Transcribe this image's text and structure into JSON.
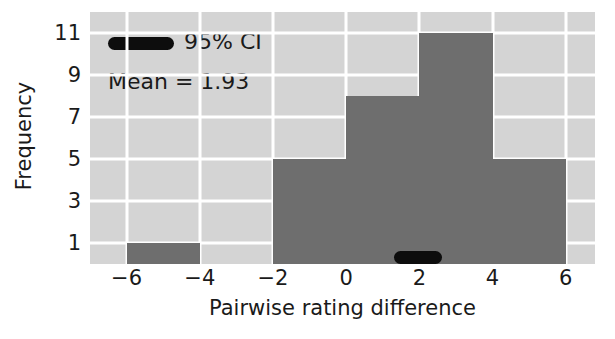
{
  "chart_data": {
    "type": "bar",
    "title": "",
    "subtitle": "",
    "xlabel": "Pairwise rating difference",
    "ylabel": "Frequency",
    "grid": true,
    "grid_color": "#ffffff",
    "plot_bg": "#d4d4d4",
    "bar_color": "#6e6e6e",
    "annotation_color": "#0d0d0d",
    "bin_width": 2,
    "bin_edges": [
      -6,
      -4,
      -2,
      0,
      2,
      4,
      6
    ],
    "categories": [
      "[-6,-4)",
      "[-4,-2)",
      "[-2,0)",
      "[0,2)",
      "[2,4)",
      "[4,6)"
    ],
    "bin_centers": [
      -5,
      -3,
      -1,
      1,
      3,
      5
    ],
    "values": [
      1,
      0,
      5,
      8,
      11,
      5
    ],
    "xlim": [
      -7,
      6.8
    ],
    "ylim": [
      0,
      12
    ],
    "xticks": [
      -6,
      -4,
      -2,
      0,
      2,
      4,
      6
    ],
    "xtick_labels": [
      "−6",
      "−4",
      "−2",
      "0",
      "2",
      "4",
      "6"
    ],
    "yticks": [
      1,
      3,
      5,
      7,
      9,
      11
    ],
    "ytick_labels": [
      "1",
      "3",
      "5",
      "7",
      "9",
      "11"
    ],
    "legend": {
      "position": "upper left",
      "entries": [
        {
          "label": "95% CI",
          "marker": "thick-rounded-line",
          "color": "#0d0d0d"
        }
      ]
    },
    "annotations": [
      {
        "name": "mean-text",
        "text": "Mean = 1.93",
        "value": 1.93
      }
    ],
    "ci_interval": {
      "name": "95% CI",
      "low": 1.32,
      "high": 2.62,
      "y": 0.35,
      "color": "#0d0d0d"
    }
  }
}
